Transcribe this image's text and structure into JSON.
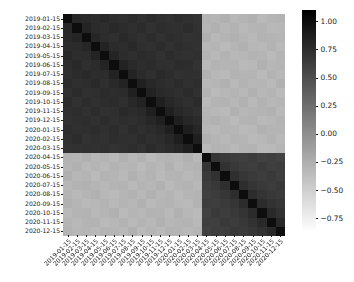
{
  "figure": {
    "background_color": "#ffffff",
    "plot": {
      "left": 63,
      "top": 14,
      "width": 222,
      "height": 222
    }
  },
  "chart_data": {
    "type": "heatmap",
    "title": "",
    "xlabel": "",
    "ylabel": "",
    "grid": false,
    "colormap": "Greys",
    "colorbar": {
      "position": "right",
      "vmin": -0.87,
      "vmax": 1.1,
      "ticks": [
        1.0,
        0.75,
        0.5,
        0.25,
        0.0,
        -0.25,
        -0.5,
        -0.75
      ],
      "tick_labels": [
        "1.00",
        "0.75",
        "0.50",
        "0.25",
        "0.00",
        "−0.25",
        "−0.50",
        "−0.75"
      ],
      "low_color": "#ffffff",
      "high_color": "#000000"
    },
    "x_tick_labels": [
      "2019-01-15",
      "2019-02-15",
      "2019-03-15",
      "2019-04-15",
      "2019-05-15",
      "2019-06-15",
      "2019-07-15",
      "2019-08-15",
      "2019-09-15",
      "2019-10-15",
      "2019-11-15",
      "2019-12-15",
      "2020-01-15",
      "2020-02-15",
      "2020-03-15",
      "2020-04-15",
      "2020-05-15",
      "2020-06-15",
      "2020-07-15",
      "2020-08-15",
      "2020-09-15",
      "2020-10-15",
      "2020-11-15",
      "2020-12-15"
    ],
    "y_tick_labels": [
      "2019-01-15",
      "2019-02-15",
      "2019-03-15",
      "2019-04-15",
      "2019-05-15",
      "2019-06-15",
      "2019-07-15",
      "2019-08-15",
      "2019-09-15",
      "2019-10-15",
      "2019-11-15",
      "2019-12-15",
      "2020-01-15",
      "2020-02-15",
      "2020-03-15",
      "2020-04-15",
      "2020-05-15",
      "2020-06-15",
      "2020-07-15",
      "2020-08-15",
      "2020-09-15",
      "2020-10-15",
      "2020-11-15",
      "2020-12-15"
    ],
    "values": [
      [
        1.0,
        0.8,
        0.78,
        0.76,
        0.79,
        0.75,
        0.74,
        0.77,
        0.73,
        0.76,
        0.74,
        0.72,
        0.75,
        0.73,
        0.71,
        -0.28,
        -0.3,
        -0.26,
        -0.31,
        -0.29,
        -0.27,
        -0.33,
        -0.3,
        -0.28
      ],
      [
        0.8,
        1.0,
        0.82,
        0.77,
        0.75,
        0.78,
        0.76,
        0.74,
        0.77,
        0.72,
        0.75,
        0.74,
        0.73,
        0.76,
        0.72,
        -0.3,
        -0.27,
        -0.31,
        -0.28,
        -0.33,
        -0.3,
        -0.29,
        -0.32,
        -0.31
      ],
      [
        0.78,
        0.82,
        1.0,
        0.81,
        0.76,
        0.74,
        0.78,
        0.75,
        0.73,
        0.76,
        0.72,
        0.75,
        0.74,
        0.71,
        0.73,
        -0.26,
        -0.32,
        -0.29,
        -0.27,
        -0.3,
        -0.33,
        -0.28,
        -0.29,
        -0.3
      ],
      [
        0.76,
        0.77,
        0.81,
        1.0,
        0.83,
        0.77,
        0.75,
        0.78,
        0.74,
        0.73,
        0.76,
        0.72,
        0.75,
        0.74,
        0.72,
        -0.31,
        -0.29,
        -0.34,
        -0.3,
        -0.27,
        -0.31,
        -0.32,
        -0.28,
        -0.33
      ],
      [
        0.79,
        0.75,
        0.76,
        0.83,
        1.0,
        0.82,
        0.76,
        0.74,
        0.77,
        0.75,
        0.72,
        0.76,
        0.73,
        0.72,
        0.74,
        -0.29,
        -0.33,
        -0.28,
        -0.32,
        -0.31,
        -0.28,
        -0.3,
        -0.34,
        -0.29
      ],
      [
        0.75,
        0.78,
        0.74,
        0.77,
        0.82,
        1.0,
        0.84,
        0.78,
        0.75,
        0.77,
        0.74,
        0.73,
        0.76,
        0.75,
        0.71,
        -0.33,
        -0.28,
        -0.3,
        -0.29,
        -0.34,
        -0.32,
        -0.27,
        -0.31,
        -0.3
      ],
      [
        0.74,
        0.76,
        0.78,
        0.75,
        0.76,
        0.84,
        1.0,
        0.83,
        0.77,
        0.74,
        0.78,
        0.75,
        0.72,
        0.74,
        0.73,
        -0.27,
        -0.31,
        -0.33,
        -0.28,
        -0.3,
        -0.29,
        -0.34,
        -0.28,
        -0.32
      ],
      [
        0.77,
        0.74,
        0.75,
        0.78,
        0.74,
        0.78,
        0.83,
        1.0,
        0.85,
        0.79,
        0.76,
        0.74,
        0.77,
        0.73,
        0.75,
        -0.32,
        -0.3,
        -0.27,
        -0.33,
        -0.28,
        -0.31,
        -0.3,
        -0.33,
        -0.27
      ],
      [
        0.73,
        0.77,
        0.73,
        0.74,
        0.77,
        0.75,
        0.77,
        0.85,
        1.0,
        0.84,
        0.78,
        0.76,
        0.74,
        0.77,
        0.72,
        -0.28,
        -0.34,
        -0.31,
        -0.29,
        -0.32,
        -0.27,
        -0.31,
        -0.29,
        -0.34
      ],
      [
        0.76,
        0.72,
        0.76,
        0.73,
        0.75,
        0.77,
        0.74,
        0.79,
        0.84,
        1.0,
        0.86,
        0.8,
        0.76,
        0.74,
        0.77,
        -0.34,
        -0.29,
        -0.28,
        -0.31,
        -0.27,
        -0.33,
        -0.28,
        -0.32,
        -0.3
      ],
      [
        0.74,
        0.75,
        0.72,
        0.76,
        0.72,
        0.74,
        0.78,
        0.76,
        0.78,
        0.86,
        1.0,
        0.85,
        0.79,
        0.76,
        0.74,
        -0.3,
        -0.32,
        -0.34,
        -0.27,
        -0.31,
        -0.3,
        -0.29,
        -0.27,
        -0.33
      ],
      [
        0.72,
        0.74,
        0.75,
        0.72,
        0.76,
        0.73,
        0.75,
        0.74,
        0.76,
        0.8,
        0.85,
        1.0,
        0.86,
        0.8,
        0.77,
        -0.29,
        -0.27,
        -0.3,
        -0.34,
        -0.29,
        -0.28,
        -0.33,
        -0.31,
        -0.28
      ],
      [
        0.75,
        0.73,
        0.74,
        0.75,
        0.73,
        0.76,
        0.72,
        0.77,
        0.74,
        0.76,
        0.79,
        0.86,
        1.0,
        0.87,
        0.81,
        -0.31,
        -0.33,
        -0.29,
        -0.3,
        -0.34,
        -0.32,
        -0.27,
        -0.3,
        -0.29
      ],
      [
        0.73,
        0.76,
        0.71,
        0.74,
        0.72,
        0.75,
        0.74,
        0.73,
        0.77,
        0.74,
        0.76,
        0.8,
        0.87,
        1.0,
        0.86,
        -0.27,
        -0.3,
        -0.32,
        -0.28,
        -0.3,
        -0.34,
        -0.31,
        -0.28,
        -0.32
      ],
      [
        0.71,
        0.72,
        0.73,
        0.72,
        0.74,
        0.71,
        0.73,
        0.75,
        0.72,
        0.77,
        0.74,
        0.77,
        0.81,
        0.86,
        1.0,
        -0.33,
        -0.28,
        -0.3,
        -0.32,
        -0.29,
        -0.28,
        -0.34,
        -0.33,
        -0.3
      ],
      [
        -0.28,
        -0.3,
        -0.26,
        -0.31,
        -0.29,
        -0.33,
        -0.27,
        -0.32,
        -0.28,
        -0.34,
        -0.3,
        -0.29,
        -0.31,
        -0.27,
        -0.33,
        1.0,
        0.7,
        0.66,
        0.63,
        0.61,
        0.64,
        0.6,
        0.62,
        0.59
      ],
      [
        -0.3,
        -0.27,
        -0.32,
        -0.29,
        -0.33,
        -0.28,
        -0.31,
        -0.3,
        -0.34,
        -0.29,
        -0.32,
        -0.27,
        -0.33,
        -0.3,
        -0.28,
        0.7,
        1.0,
        0.72,
        0.67,
        0.64,
        0.62,
        0.65,
        0.61,
        0.63
      ],
      [
        -0.26,
        -0.31,
        -0.29,
        -0.34,
        -0.28,
        -0.3,
        -0.33,
        -0.27,
        -0.31,
        -0.28,
        -0.34,
        -0.3,
        -0.29,
        -0.32,
        -0.3,
        0.66,
        0.72,
        1.0,
        0.74,
        0.68,
        0.65,
        0.63,
        0.66,
        0.62
      ],
      [
        -0.31,
        -0.28,
        -0.27,
        -0.3,
        -0.32,
        -0.29,
        -0.28,
        -0.33,
        -0.29,
        -0.31,
        -0.27,
        -0.34,
        -0.3,
        -0.28,
        -0.32,
        0.63,
        0.67,
        0.74,
        1.0,
        0.75,
        0.69,
        0.66,
        0.64,
        0.67
      ],
      [
        -0.29,
        -0.33,
        -0.3,
        -0.27,
        -0.31,
        -0.34,
        -0.3,
        -0.28,
        -0.32,
        -0.27,
        -0.31,
        -0.29,
        -0.34,
        -0.3,
        -0.29,
        0.61,
        0.64,
        0.68,
        0.75,
        1.0,
        0.76,
        0.7,
        0.67,
        0.65
      ],
      [
        -0.27,
        -0.3,
        -0.33,
        -0.31,
        -0.28,
        -0.32,
        -0.29,
        -0.31,
        -0.27,
        -0.33,
        -0.3,
        -0.28,
        -0.32,
        -0.34,
        -0.28,
        0.64,
        0.62,
        0.65,
        0.69,
        0.76,
        1.0,
        0.77,
        0.71,
        0.68
      ],
      [
        -0.33,
        -0.29,
        -0.28,
        -0.32,
        -0.3,
        -0.27,
        -0.34,
        -0.3,
        -0.31,
        -0.28,
        -0.29,
        -0.33,
        -0.27,
        -0.31,
        -0.34,
        0.6,
        0.65,
        0.63,
        0.66,
        0.7,
        0.77,
        1.0,
        0.78,
        0.72
      ],
      [
        -0.3,
        -0.32,
        -0.29,
        -0.28,
        -0.34,
        -0.31,
        -0.28,
        -0.33,
        -0.29,
        -0.32,
        -0.27,
        -0.31,
        -0.3,
        -0.28,
        -0.33,
        0.62,
        0.61,
        0.66,
        0.64,
        0.67,
        0.71,
        0.78,
        1.0,
        0.79
      ],
      [
        -0.28,
        -0.31,
        -0.3,
        -0.33,
        -0.29,
        -0.3,
        -0.32,
        -0.27,
        -0.34,
        -0.3,
        -0.33,
        -0.28,
        -0.29,
        -0.32,
        -0.3,
        0.59,
        0.63,
        0.62,
        0.67,
        0.65,
        0.68,
        0.72,
        0.79,
        1.0
      ]
    ]
  }
}
